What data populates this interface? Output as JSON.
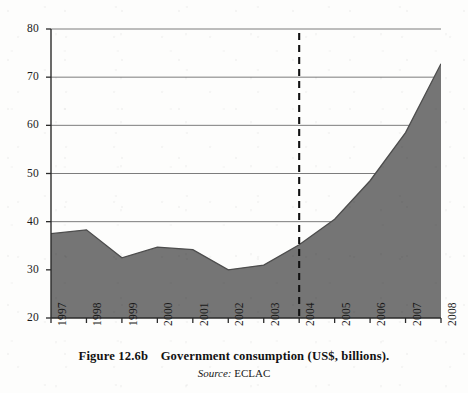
{
  "caption": {
    "figure_label": "Figure 12.6b",
    "figure_title": "Government consumption (US$, billions).",
    "source_word": "Source:",
    "source_name": "ECLAC"
  },
  "chart_data": {
    "type": "area",
    "title": "Government consumption (US$, billions).",
    "xlabel": "",
    "ylabel": "",
    "categories": [
      "1997",
      "1998",
      "1999",
      "2000",
      "2001",
      "2002",
      "2003",
      "2004",
      "2005",
      "2006",
      "2007",
      "2008"
    ],
    "x": [
      1997,
      1998,
      1999,
      2000,
      2001,
      2002,
      2003,
      2004,
      2005,
      2006,
      2007,
      2008
    ],
    "values": [
      37.5,
      38.3,
      32.5,
      34.7,
      34.2,
      30.0,
      31.0,
      35.2,
      40.5,
      48.5,
      58.5,
      72.8
    ],
    "series": [
      {
        "name": "Government consumption",
        "values": [
          37.5,
          38.3,
          32.5,
          34.7,
          34.2,
          30.0,
          31.0,
          35.2,
          40.5,
          48.5,
          58.5,
          72.8
        ]
      }
    ],
    "ylim": [
      20,
      80
    ],
    "xlim": [
      1997,
      2008
    ],
    "yticks": [
      20,
      30,
      40,
      50,
      60,
      70,
      80
    ],
    "ytick_labels": [
      "20",
      "30",
      "40",
      "50",
      "60",
      "70",
      "80"
    ],
    "xtick_labels": [
      "1997",
      "1998",
      "1999",
      "2000",
      "2001",
      "2002",
      "2003",
      "2004",
      "2005",
      "2006",
      "2007",
      "2008"
    ],
    "grid": true,
    "grid_axis": "y",
    "legend": false,
    "legend_position": "none",
    "annotations": [
      {
        "type": "vertical-dashed-line",
        "x": 2004,
        "label": "2004"
      }
    ],
    "colors": {
      "area_fill": "#757575",
      "area_line": "#4d4d4d",
      "gridline": "#7a7a7a",
      "axis": "#2b2b2b",
      "annotation_line": "#111111",
      "background": "#ffffff"
    }
  }
}
